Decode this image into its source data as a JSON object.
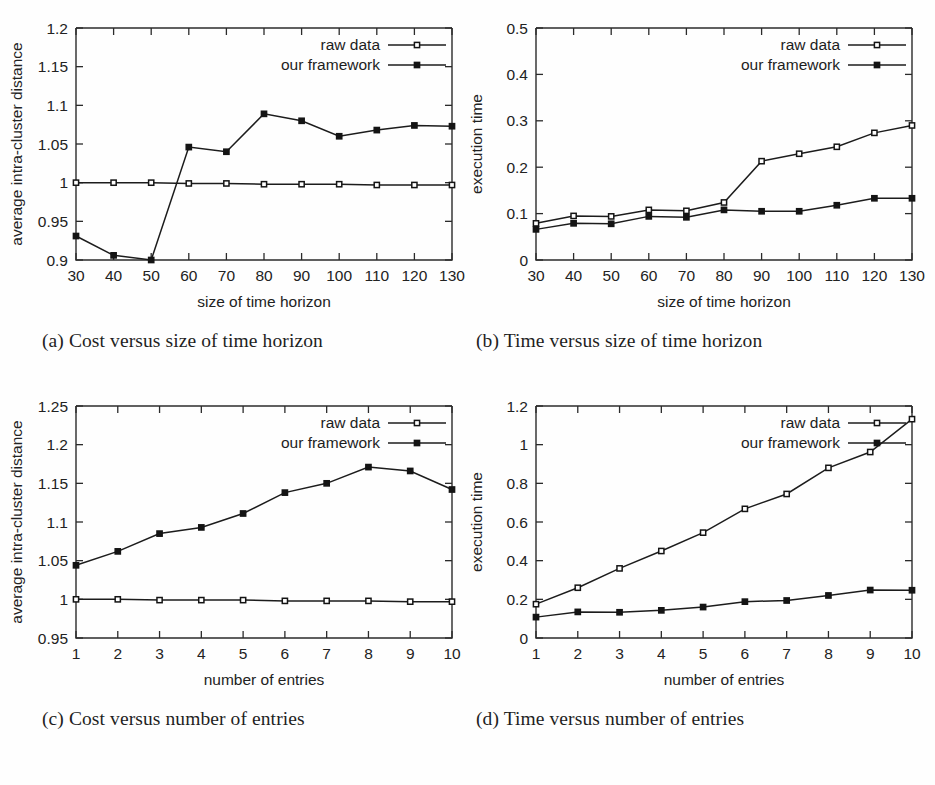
{
  "figure": {
    "panel_labels": [
      "(a)",
      "(b)",
      "(c)",
      "(d)"
    ],
    "legend_labels": {
      "raw": "raw data",
      "ours": "our framework"
    },
    "colors": {
      "line": "#141414",
      "marker_fill_raw": "#ffffff",
      "marker_fill_ours": "#141414",
      "axis": "#2b2b2b",
      "background": "#ffffff"
    }
  },
  "panels": [
    {
      "id": "a",
      "caption": "(a) Cost versus size of time horizon"
    },
    {
      "id": "b",
      "caption": "(b) Time versus size of time horizon"
    },
    {
      "id": "c",
      "caption": "(c) Cost versus number of entries"
    },
    {
      "id": "d",
      "caption": "(d) Time versus number of entries"
    }
  ],
  "chart_data": [
    {
      "id": "a",
      "type": "line",
      "title": "",
      "xlabel": "size of time horizon",
      "ylabel": "average intra-cluster distance",
      "x": [
        30,
        40,
        50,
        60,
        70,
        80,
        90,
        100,
        110,
        120,
        130
      ],
      "xticklabels": [
        "30",
        "40",
        "50",
        "60",
        "70",
        "80",
        "90",
        "100",
        "110",
        "120",
        "130"
      ],
      "xlim": [
        30,
        130
      ],
      "ylim": [
        0.9,
        1.2
      ],
      "yticks": [
        0.9,
        0.95,
        1,
        1.05,
        1.1,
        1.15,
        1.2
      ],
      "yticklabels": [
        "0.9",
        "0.95",
        "1",
        "1.05",
        "1.1",
        "1.15",
        "1.2"
      ],
      "grid": false,
      "legend_position": "top-right",
      "series": [
        {
          "name": "raw data",
          "marker": "open-square",
          "values": [
            1.0,
            1.0,
            1.0,
            0.999,
            0.999,
            0.998,
            0.998,
            0.998,
            0.997,
            0.997,
            0.997
          ]
        },
        {
          "name": "our framework",
          "marker": "filled-square",
          "values": [
            0.931,
            0.906,
            0.9,
            1.046,
            1.04,
            1.089,
            1.08,
            1.06,
            1.068,
            1.074,
            1.073
          ]
        }
      ]
    },
    {
      "id": "b",
      "type": "line",
      "title": "",
      "xlabel": "size of time horizon",
      "ylabel": "execution time",
      "x": [
        30,
        40,
        50,
        60,
        70,
        80,
        90,
        100,
        110,
        120,
        130
      ],
      "xticklabels": [
        "30",
        "40",
        "50",
        "60",
        "70",
        "80",
        "90",
        "100",
        "110",
        "120",
        "130"
      ],
      "xlim": [
        30,
        130
      ],
      "ylim": [
        0,
        0.5
      ],
      "yticks": [
        0,
        0.1,
        0.2,
        0.3,
        0.4,
        0.5
      ],
      "yticklabels": [
        "0",
        "0.1",
        "0.2",
        "0.3",
        "0.4",
        "0.5"
      ],
      "grid": false,
      "legend_position": "top-right",
      "series": [
        {
          "name": "raw data",
          "marker": "open-square",
          "values": [
            0.079,
            0.095,
            0.094,
            0.108,
            0.106,
            0.124,
            0.213,
            0.229,
            0.244,
            0.274,
            0.29
          ]
        },
        {
          "name": "our framework",
          "marker": "filled-square",
          "values": [
            0.066,
            0.079,
            0.078,
            0.094,
            0.092,
            0.108,
            0.105,
            0.105,
            0.118,
            0.133,
            0.133
          ]
        }
      ]
    },
    {
      "id": "c",
      "type": "line",
      "title": "",
      "xlabel": "number of entries",
      "ylabel": "average intra-cluster distance",
      "x": [
        1,
        2,
        3,
        4,
        5,
        6,
        7,
        8,
        9,
        10
      ],
      "xticklabels": [
        "1",
        "2",
        "3",
        "4",
        "5",
        "6",
        "7",
        "8",
        "9",
        "10"
      ],
      "xlim": [
        1,
        10
      ],
      "ylim": [
        0.95,
        1.25
      ],
      "yticks": [
        0.95,
        1,
        1.05,
        1.1,
        1.15,
        1.2,
        1.25
      ],
      "yticklabels": [
        "0.95",
        "1",
        "1.05",
        "1.1",
        "1.15",
        "1.2",
        "1.25"
      ],
      "grid": false,
      "legend_position": "top-right",
      "series": [
        {
          "name": "raw data",
          "marker": "open-square",
          "values": [
            1.0,
            1.0,
            0.999,
            0.999,
            0.999,
            0.998,
            0.998,
            0.998,
            0.997,
            0.997
          ]
        },
        {
          "name": "our framework",
          "marker": "filled-square",
          "values": [
            1.044,
            1.062,
            1.085,
            1.093,
            1.111,
            1.138,
            1.15,
            1.171,
            1.166,
            1.142
          ]
        }
      ]
    },
    {
      "id": "d",
      "type": "line",
      "title": "",
      "xlabel": "number of entries",
      "ylabel": "execution time",
      "x": [
        1,
        2,
        3,
        4,
        5,
        6,
        7,
        8,
        9,
        10
      ],
      "xticklabels": [
        "1",
        "2",
        "3",
        "4",
        "5",
        "6",
        "7",
        "8",
        "9",
        "10"
      ],
      "xlim": [
        1,
        10
      ],
      "ylim": [
        0,
        1.2
      ],
      "yticks": [
        0,
        0.2,
        0.4,
        0.6,
        0.8,
        1,
        1.2
      ],
      "yticklabels": [
        "0",
        "0.2",
        "0.4",
        "0.6",
        "0.8",
        "1",
        "1.2"
      ],
      "grid": false,
      "legend_position": "top-right",
      "series": [
        {
          "name": "raw data",
          "marker": "open-square",
          "values": [
            0.175,
            0.26,
            0.36,
            0.45,
            0.545,
            0.668,
            0.745,
            0.88,
            0.962,
            1.132
          ]
        },
        {
          "name": "our framework",
          "marker": "filled-square",
          "values": [
            0.108,
            0.135,
            0.133,
            0.143,
            0.16,
            0.188,
            0.194,
            0.22,
            0.248,
            0.247
          ]
        }
      ]
    }
  ]
}
